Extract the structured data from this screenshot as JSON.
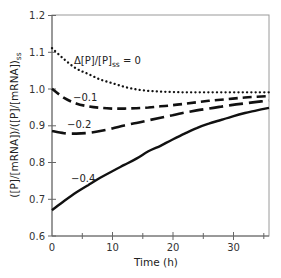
{
  "chart_data": {
    "type": "line",
    "title": "",
    "xlabel": "Time (h)",
    "ylabel": "([P]/[mRNA])/([P]/[mRNA])ss",
    "xlim": [
      0,
      36
    ],
    "ylim": [
      0.6,
      1.2
    ],
    "x_ticks": [
      0,
      10,
      20,
      30
    ],
    "x_minor_ticks": [
      5,
      15,
      25,
      35
    ],
    "y_ticks": [
      0.6,
      0.7,
      0.8,
      0.9,
      1.0,
      1.1,
      1.2
    ],
    "grid": false,
    "legend": "inline annotations",
    "x": [
      0,
      2,
      4,
      6,
      8,
      10,
      12,
      14,
      16,
      18,
      20,
      22,
      24,
      26,
      28,
      30,
      32,
      34,
      36
    ],
    "series": [
      {
        "name": "Δ[P]/[P]ss = 0",
        "style": "dotted",
        "values": [
          1.11,
          1.08,
          1.055,
          1.04,
          1.025,
          1.015,
          1.005,
          0.998,
          0.994,
          0.992,
          0.991,
          0.99,
          0.99,
          0.99,
          0.99,
          0.99,
          0.99,
          0.99,
          0.99
        ]
      },
      {
        "name": "-0.1",
        "style": "short-dash",
        "values": [
          1.0,
          0.975,
          0.96,
          0.952,
          0.948,
          0.946,
          0.946,
          0.947,
          0.949,
          0.952,
          0.955,
          0.959,
          0.963,
          0.967,
          0.97,
          0.973,
          0.976,
          0.978,
          0.98
        ]
      },
      {
        "name": "-0.2",
        "style": "long-dash",
        "values": [
          0.885,
          0.879,
          0.878,
          0.88,
          0.885,
          0.892,
          0.9,
          0.907,
          0.914,
          0.921,
          0.928,
          0.935,
          0.941,
          0.946,
          0.951,
          0.956,
          0.96,
          0.964,
          0.968
        ]
      },
      {
        "name": "-0.4",
        "style": "solid",
        "values": [
          0.67,
          0.695,
          0.718,
          0.738,
          0.758,
          0.776,
          0.793,
          0.81,
          0.83,
          0.845,
          0.862,
          0.878,
          0.893,
          0.905,
          0.915,
          0.925,
          0.934,
          0.941,
          0.948
        ]
      }
    ],
    "annotations": [
      {
        "text_main": "Δ[P]/[P]",
        "text_sub": "ss",
        "text_tail": " = 0",
        "series": 0
      },
      {
        "text": "−0.1",
        "series": 1
      },
      {
        "text": "−0.2",
        "series": 2
      },
      {
        "text": "−0.4",
        "series": 3
      }
    ]
  },
  "labels": {
    "xlabel": "Time (h)",
    "ylabel_main": "([P]/[mRNA])/([P]/[mRNA])",
    "ylabel_sub": "ss",
    "annot0_main": "Δ[P]/[P]",
    "annot0_sub": "ss",
    "annot0_tail": " = 0",
    "annot1": "−0.1",
    "annot2": "−0.2",
    "annot3": "−0.4",
    "yticks": [
      "0.6",
      "0.7",
      "0.8",
      "0.9",
      "1.0",
      "1.1",
      "1.2"
    ],
    "xticks": [
      "0",
      "10",
      "20",
      "30"
    ]
  }
}
